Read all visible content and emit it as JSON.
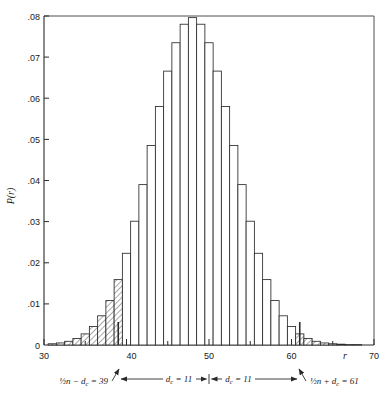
{
  "chart_data": {
    "type": "bar",
    "title": "",
    "subtitle": "",
    "xlabel": "r",
    "ylabel": "P(r)",
    "xlim": [
      30,
      70
    ],
    "ylim": [
      0,
      0.08
    ],
    "grid": false,
    "legend": null,
    "x_ticks": [
      30,
      40,
      50,
      60,
      70
    ],
    "x_tick_labels": [
      "30",
      "40",
      "50",
      "60",
      "70"
    ],
    "x_minor_ticks": [
      35,
      45,
      55,
      65
    ],
    "y_ticks": [
      0,
      0.01,
      0.02,
      0.03,
      0.04,
      0.05,
      0.06,
      0.07,
      0.08
    ],
    "y_tick_labels": [
      "0",
      ".01",
      ".02",
      ".03",
      ".04",
      ".05",
      ".06",
      ".07",
      ".08"
    ],
    "bar_width": 1,
    "categories": [
      31,
      32,
      33,
      34,
      35,
      36,
      37,
      38,
      39,
      40,
      41,
      42,
      43,
      44,
      45,
      46,
      47,
      48,
      49,
      50,
      51,
      52,
      53,
      54,
      55,
      56,
      57,
      58,
      59,
      60,
      61,
      62,
      63,
      64,
      65,
      66,
      67,
      68
    ],
    "values": [
      0.0003,
      0.0005,
      0.0009,
      0.0016,
      0.0027,
      0.0045,
      0.0071,
      0.0108,
      0.0159,
      0.0223,
      0.0301,
      0.039,
      0.0485,
      0.058,
      0.0666,
      0.0735,
      0.078,
      0.0796,
      0.078,
      0.0735,
      0.0666,
      0.058,
      0.0485,
      0.039,
      0.0301,
      0.0223,
      0.0159,
      0.0108,
      0.0071,
      0.0045,
      0.0027,
      0.0016,
      0.0009,
      0.0005,
      0.0003,
      0.0002,
      0.0001,
      0.0001
    ],
    "hatched_ranges": [
      [
        30,
        39
      ],
      [
        61,
        70
      ]
    ],
    "hatched_note": "tail regions r < 39 and r > 61 are cross-hatched"
  },
  "annotations": {
    "left_label": {
      "prefix": "½n − d",
      "sub": "c",
      "suffix": " = 39"
    },
    "right_label": {
      "prefix": "½n + d",
      "sub": "c",
      "suffix": " = 61"
    },
    "dim_left": {
      "prefix": "d",
      "sub": "c",
      "suffix": " = 11"
    },
    "dim_right": {
      "prefix": "d",
      "sub": "c",
      "suffix": " = 11"
    }
  },
  "axis": {
    "x_title": "r",
    "y_title": "P(r)"
  }
}
